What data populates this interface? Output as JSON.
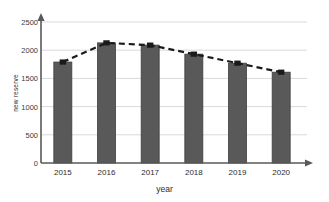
{
  "chart_data": {
    "type": "bar",
    "title": "",
    "subtitle": "",
    "xlabel": "year",
    "ylabel": "new reserve",
    "categories": [
      "2015",
      "2016",
      "2017",
      "2018",
      "2019",
      "2020"
    ],
    "values": [
      1790,
      2130,
      2090,
      1930,
      1770,
      1610
    ],
    "series": [
      {
        "name": "new reserve",
        "type": "bar",
        "values": [
          1790,
          2130,
          2090,
          1930,
          1770,
          1610
        ]
      },
      {
        "name": "trend",
        "type": "line",
        "style": "dashed-with-square-markers",
        "values": [
          1790,
          2130,
          2090,
          1930,
          1770,
          1610
        ]
      }
    ],
    "ylim": [
      0,
      2500
    ],
    "yticks": [
      0,
      500,
      1000,
      1500,
      2000,
      2500
    ],
    "ytick_labels": [
      "0",
      "500",
      "1000",
      "1500",
      "2000",
      "2500"
    ],
    "grid": true,
    "grid_axis": "y",
    "legend": false,
    "legend_position": "none",
    "axis_arrows": true,
    "colors": {
      "bar_fill": "#595959",
      "bar_edge": "#3f3f3f",
      "line": "#1a1a1a",
      "marker": "#1a1a1a",
      "grid": "#d9d9d9",
      "axis": "#595959",
      "text": "#2b2b2b",
      "background": "#ffffff"
    }
  }
}
